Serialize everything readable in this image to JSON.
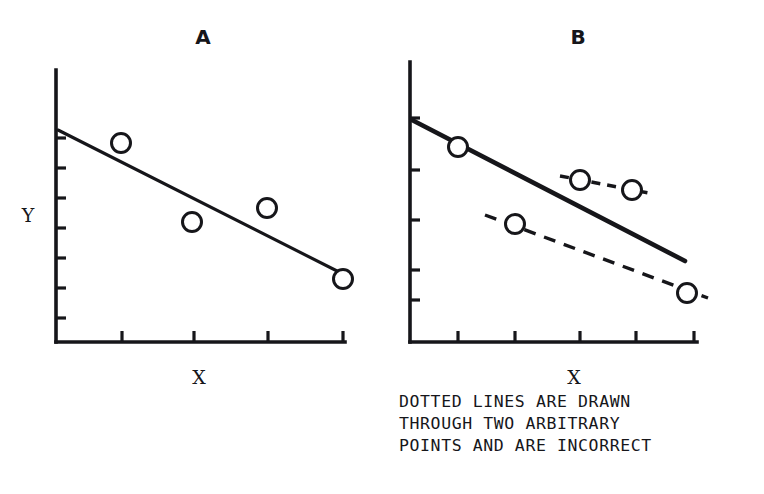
{
  "figure": {
    "background_color": "#ffffff",
    "ink_color": "#16161a",
    "width": 764,
    "height": 494
  },
  "caption": {
    "name": "figure-caption",
    "lines": [
      "DOTTED LINES ARE DRAWN",
      "THROUGH TWO ARBITRARY",
      "POINTS AND ARE INCORRECT"
    ],
    "x": 399,
    "y_start": 407,
    "line_height": 22
  },
  "chart_data": [
    {
      "type": "scatter",
      "panel": "A",
      "title": "A",
      "title_x": 203,
      "title_y": 44,
      "xlabel": "X",
      "ylabel": "Y",
      "xlabel_x": 199,
      "xlabel_y": 384,
      "ylabel_x": 28,
      "ylabel_y": 222,
      "grid": false,
      "legend": "none",
      "description": "Correct least-squares regression line fitted through four data points",
      "axes": {
        "x_axis": {
          "x1": 56,
          "y1": 342,
          "x2": 345,
          "y2": 342
        },
        "y_axis": {
          "x1": 56,
          "y1": 70,
          "x2": 56,
          "y2": 342
        },
        "x_ticks": [
          122,
          194,
          268,
          343
        ],
        "y_ticks": [
          138,
          168,
          198,
          228,
          258,
          288,
          318
        ],
        "x_tick_length": 11,
        "y_tick_length": 10
      },
      "points": [
        {
          "label": "p1",
          "cx": 121,
          "cy": 143,
          "r": 9.5
        },
        {
          "label": "p2",
          "cx": 192,
          "cy": 222,
          "r": 9.5
        },
        {
          "label": "p3",
          "cx": 267,
          "cy": 208,
          "r": 9.5
        },
        {
          "label": "p4",
          "cx": 343,
          "cy": 279,
          "r": 9.5
        }
      ],
      "lines": [
        {
          "name": "regression-line",
          "style": "solid",
          "weight": "thin",
          "correct": true,
          "x1": 58,
          "y1": 130,
          "x2": 345,
          "y2": 275
        }
      ]
    },
    {
      "type": "scatter",
      "panel": "B",
      "title": "B",
      "title_x": 578,
      "title_y": 44,
      "xlabel": "X",
      "ylabel": "",
      "xlabel_x": 574,
      "xlabel_y": 384,
      "grid": false,
      "legend": "none",
      "description": "Same data with two dotted lines drawn through arbitrary point pairs, shown as incorrect, alongside the correct solid regression line",
      "axes": {
        "x_axis": {
          "x1": 410,
          "y1": 342,
          "x2": 697,
          "y2": 342
        },
        "y_axis": {
          "x1": 410,
          "y1": 62,
          "x2": 410,
          "y2": 342
        },
        "x_ticks": [
          458,
          515,
          580,
          636,
          694
        ],
        "y_ticks": [
          118,
          170,
          220,
          270,
          300
        ],
        "x_tick_length": 11,
        "y_tick_length": 10
      },
      "points": [
        {
          "label": "p1",
          "cx": 458,
          "cy": 147,
          "r": 9.5
        },
        {
          "label": "p2",
          "cx": 580,
          "cy": 180,
          "r": 9.5
        },
        {
          "label": "p3",
          "cx": 632,
          "cy": 190,
          "r": 9.5
        },
        {
          "label": "p4",
          "cx": 515,
          "cy": 224,
          "r": 9.5
        },
        {
          "label": "p5",
          "cx": 687,
          "cy": 293,
          "r": 9.5
        }
      ],
      "lines": [
        {
          "name": "regression-line",
          "style": "solid",
          "weight": "thick",
          "correct": true,
          "x1": 412,
          "y1": 120,
          "x2": 685,
          "y2": 261
        },
        {
          "name": "arbitrary-line-upper",
          "style": "dashed",
          "weight": "thin",
          "correct": false,
          "dash": "9,7",
          "x1": 560,
          "y1": 176,
          "x2": 654,
          "y2": 194
        },
        {
          "name": "arbitrary-line-lower",
          "style": "dashed",
          "weight": "thin",
          "correct": false,
          "dash": "12,9",
          "x1": 485,
          "y1": 215,
          "x2": 708,
          "y2": 298
        }
      ]
    }
  ]
}
